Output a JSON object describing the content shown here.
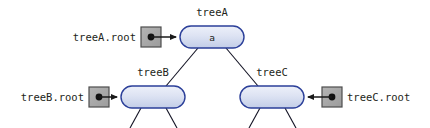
{
  "figure": {
    "background_color": "#ffffff",
    "width": 430,
    "height": 128
  },
  "style": {
    "node_fill_top": "#e8ecf7",
    "node_fill_bottom": "#c3cde8",
    "node_stroke": "#2b3f99",
    "pointer_box_fill": "#a8a8a8",
    "pointer_box_stroke": "#4d4d4d",
    "pointer_dot_color": "#111111",
    "arrow_color": "#1a1a1a",
    "edge_color": "#111122",
    "text_color": "#231f20"
  },
  "nodes": [
    {
      "id": "treeA",
      "title": "treeA",
      "value": "a",
      "cx": 212,
      "cy": 37,
      "rx": 32,
      "ry": 11
    },
    {
      "id": "treeB",
      "title": "treeB",
      "value": "",
      "cx": 153,
      "cy": 97,
      "rx": 32,
      "ry": 11
    },
    {
      "id": "treeC",
      "title": "treeC",
      "value": "",
      "cx": 272,
      "cy": 97,
      "rx": 32,
      "ry": 11
    }
  ],
  "pointers": [
    {
      "id": "treeA-root",
      "label": "treeA.root",
      "label_anchor": "end",
      "direction": "right",
      "box_x": 141,
      "box_y": 27,
      "box_size": 20,
      "label_x": 136,
      "label_y": 41,
      "arrow_from_x": 161,
      "arrow_to_x": 179,
      "arrow_y": 37
    },
    {
      "id": "treeB-root",
      "label": "treeB.root",
      "label_anchor": "end",
      "direction": "right",
      "box_x": 89,
      "box_y": 87,
      "box_size": 20,
      "label_x": 84,
      "label_y": 101,
      "arrow_from_x": 109,
      "arrow_to_x": 120,
      "arrow_y": 97
    },
    {
      "id": "treeC-root",
      "label": "treeC.root",
      "label_anchor": "start",
      "direction": "left",
      "box_x": 322,
      "box_y": 87,
      "box_size": 20,
      "label_x": 347,
      "label_y": 101,
      "arrow_from_x": 322,
      "arrow_to_x": 305,
      "arrow_y": 97
    }
  ],
  "edges": [
    {
      "id": "treeA-to-treeB",
      "x1": 198,
      "y1": 48,
      "x2": 166,
      "y2": 86
    },
    {
      "id": "treeA-to-treeC",
      "x1": 226,
      "y1": 48,
      "x2": 258,
      "y2": 86
    },
    {
      "id": "treeB-child-left",
      "x1": 141,
      "y1": 108,
      "x2": 130,
      "y2": 128
    },
    {
      "id": "treeB-child-right",
      "x1": 166,
      "y1": 108,
      "x2": 177,
      "y2": 128
    },
    {
      "id": "treeC-child-left",
      "x1": 260,
      "y1": 108,
      "x2": 249,
      "y2": 128
    },
    {
      "id": "treeC-child-right",
      "x1": 285,
      "y1": 108,
      "x2": 296,
      "y2": 128
    }
  ]
}
